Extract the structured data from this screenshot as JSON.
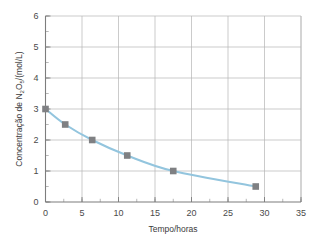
{
  "chart_data": {
    "type": "line",
    "title": "",
    "subtitle": "",
    "xlabel": "Tempo/horas",
    "ylabel_prefix": "Concentração de N",
    "ylabel_sub1": "2",
    "ylabel_mid": "O",
    "ylabel_sub2": "5",
    "ylabel_suffix": "/(mol/L)",
    "ylabel": "Concentração de N2O5/(mol/L)",
    "xlim": [
      0,
      35
    ],
    "ylim": [
      0,
      6
    ],
    "xticks": [
      0,
      5,
      10,
      15,
      20,
      25,
      30,
      35
    ],
    "yticks": [
      0,
      1,
      2,
      3,
      4,
      5,
      6
    ],
    "xtick_labels": [
      "0",
      "5",
      "10",
      "15",
      "20",
      "25",
      "30",
      "35"
    ],
    "ytick_labels": [
      "0",
      "1",
      "2",
      "3",
      "4",
      "5",
      "6"
    ],
    "x_minor_step": 2.5,
    "y_minor_step": 0.5,
    "grid": true,
    "legend": "none",
    "series": [
      {
        "name": "N2O5",
        "marker": "square",
        "marker_color": "#7f8083",
        "line_color": "#93c5de",
        "x": [
          0,
          2.7,
          6.4,
          11.2,
          17.5,
          28.8
        ],
        "y": [
          3.0,
          2.5,
          2.0,
          1.5,
          1.0,
          0.5
        ]
      }
    ]
  },
  "style": {
    "background": "#ffffff",
    "grid_color": "#b4b4b4",
    "axis_color": "#7d7d7d",
    "text_color": "#3a3a3a",
    "accent": "#93c5de",
    "marker_color": "#7f8083"
  }
}
